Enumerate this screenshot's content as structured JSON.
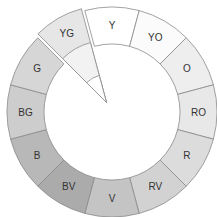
{
  "diagram": {
    "type": "color-wheel",
    "center": [
      112,
      112
    ],
    "outer_radius": 105,
    "inner_radius": 68,
    "segments": [
      {
        "label": "Y",
        "fill": "#ffffff"
      },
      {
        "label": "YO",
        "fill": "#fbfbfb"
      },
      {
        "label": "O",
        "fill": "#eeeeee"
      },
      {
        "label": "RO",
        "fill": "#e8e8e8"
      },
      {
        "label": "R",
        "fill": "#dcdcdc"
      },
      {
        "label": "RV",
        "fill": "#d2d2d2"
      },
      {
        "label": "V",
        "fill": "#c4c4c4"
      },
      {
        "label": "BV",
        "fill": "#ababab"
      },
      {
        "label": "B",
        "fill": "#b8b8b8"
      },
      {
        "label": "BG",
        "fill": "#cdcdcd"
      },
      {
        "label": "G",
        "fill": "#d6d6d6"
      },
      {
        "label": "YG",
        "fill": "#e6e6e6",
        "exploded": true,
        "inner_fill": "#f2f2f2",
        "tip_fill": "#ffffff"
      }
    ]
  }
}
